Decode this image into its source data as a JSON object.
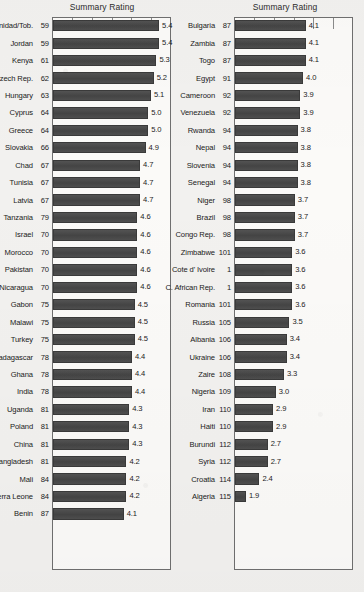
{
  "chart_data": {
    "type": "bar",
    "orientation": "horizontal",
    "title": "Summary Rating",
    "xlabel": "",
    "ylabel": "",
    "grid": false,
    "legend": false,
    "axis_tick_labels": [],
    "axis_tick_count": 5,
    "xlim": [
      1.5,
      5.8
    ],
    "panels": [
      {
        "title": "Summary Rating",
        "categories": [
          "Trinidad/Tob. 59",
          "Jordan 59",
          "Kenya 61",
          "Czech Rep. 62",
          "Hungary 63",
          "Cyprus 64",
          "Greece 64",
          "Slovakia 66",
          "Chad 67",
          "Tunisia 67",
          "Latvia 67",
          "Tanzania 79",
          "Israel 70",
          "Morocco 70",
          "Pakistan 70",
          "Nicaragua 70",
          "Gabon 75",
          "Malawi 75",
          "Turkey 75",
          "Madagascar 78",
          "Ghana 78",
          "India 78",
          "Uganda 81",
          "Poland 81",
          "China 81",
          "Bangladesh 81",
          "Mali 84",
          "Sierra Leone 84",
          "Benin 87"
        ],
        "names": [
          "Trinidad/Tob.",
          "Jordan",
          "Kenya",
          "Czech Rep.",
          "Hungary",
          "Cyprus",
          "Greece",
          "Slovakia",
          "Chad",
          "Tunisia",
          "Latvia",
          "Tanzania",
          "Israel",
          "Morocco",
          "Pakistan",
          "Nicaragua",
          "Gabon",
          "Malawi",
          "Turkey",
          "Madagascar",
          "Ghana",
          "India",
          "Uganda",
          "Poland",
          "China",
          "Bangladesh",
          "Mali",
          "Sierra Leone",
          "Benin"
        ],
        "ranks": [
          "59",
          "59",
          "61",
          "62",
          "63",
          "64",
          "64",
          "66",
          "67",
          "67",
          "67",
          "79",
          "70",
          "70",
          "70",
          "70",
          "75",
          "75",
          "75",
          "78",
          "78",
          "78",
          "81",
          "81",
          "81",
          "81",
          "84",
          "84",
          "87"
        ],
        "values": [
          5.4,
          5.4,
          5.3,
          5.2,
          5.1,
          5.0,
          5.0,
          4.9,
          4.7,
          4.7,
          4.7,
          4.6,
          4.6,
          4.6,
          4.6,
          4.6,
          4.5,
          4.5,
          4.5,
          4.4,
          4.4,
          4.4,
          4.3,
          4.3,
          4.3,
          4.2,
          4.2,
          4.2,
          4.1
        ],
        "value_labels": [
          "5.4",
          "5.4",
          "5.3",
          "5.2",
          "5.1",
          "5.0",
          "5.0",
          "4.9",
          "4.7",
          "4.7",
          "4.7",
          "4.6",
          "4.6",
          "4.6",
          "4.6",
          "4.6",
          "4.5",
          "4.5",
          "4.5",
          "4.4",
          "4.4",
          "4.4",
          "4.3",
          "4.3",
          "4.3",
          "4.2",
          "4.2",
          "4.2",
          "4.1"
        ]
      },
      {
        "title": "Summary Rating",
        "categories": [
          "Bulgaria 87",
          "Zambia 87",
          "Togo 87",
          "Egypt 91",
          "Cameroon 92",
          "Venezuela 92",
          "Rwanda 94",
          "Nepal 94",
          "Slovenia 94",
          "Senegal 94",
          "Niger 98",
          "Brazil 98",
          "Congo Rep. 98",
          "Zimbabwe 101",
          "Cote d' Ivoire 1",
          "C. African Rep. 1",
          "Romania 101",
          "Russia 105",
          "Albania 106",
          "Ukraine 106",
          "Zaire 108",
          "Nigeria 109",
          "Iran 110",
          "Haiti 110",
          "Burundi 112",
          "Syria 112",
          "Croatia 114",
          "Algeria 115"
        ],
        "names": [
          "Bulgaria",
          "Zambia",
          "Togo",
          "Egypt",
          "Cameroon",
          "Venezuela",
          "Rwanda",
          "Nepal",
          "Slovenia",
          "Senegal",
          "Niger",
          "Brazil",
          "Congo Rep.",
          "Zimbabwe",
          "Cote d' Ivoire",
          "C. African Rep.",
          "Romania",
          "Russia",
          "Albania",
          "Ukraine",
          "Zaire",
          "Nigeria",
          "Iran",
          "Haiti",
          "Burundi",
          "Syria",
          "Croatia",
          "Algeria"
        ],
        "ranks": [
          "87",
          "87",
          "87",
          "91",
          "92",
          "92",
          "94",
          "94",
          "94",
          "94",
          "98",
          "98",
          "98",
          "101",
          "1",
          "1",
          "101",
          "105",
          "106",
          "106",
          "108",
          "109",
          "110",
          "110",
          "112",
          "112",
          "114",
          "115"
        ],
        "values": [
          4.1,
          4.1,
          4.1,
          4.0,
          3.9,
          3.9,
          3.8,
          3.8,
          3.8,
          3.8,
          3.7,
          3.7,
          3.7,
          3.6,
          3.6,
          3.6,
          3.6,
          3.5,
          3.4,
          3.4,
          3.3,
          3.0,
          2.9,
          2.9,
          2.7,
          2.7,
          2.4,
          1.9
        ],
        "value_labels": [
          "4.1",
          "4.1",
          "4.1",
          "4.0",
          "3.9",
          "3.9",
          "3.8",
          "3.8",
          "3.8",
          "3.8",
          "3.7",
          "3.7",
          "3.7",
          "3.6",
          "3.6",
          "3.6",
          "3.6",
          "3.5",
          "3.4",
          "3.4",
          "3.3",
          "3.0",
          "2.9",
          "2.9",
          "2.7",
          "2.7",
          "2.4",
          "1.9"
        ]
      }
    ]
  }
}
